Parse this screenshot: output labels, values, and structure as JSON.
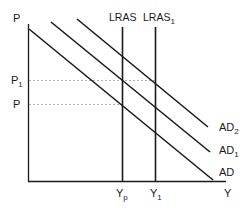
{
  "diagram": {
    "type": "economics-ad-lras",
    "axes": {
      "y_label": "P",
      "x_label": "Y"
    },
    "price_levels": [
      {
        "id": "p1",
        "label_base": "P",
        "label_sub": "1"
      },
      {
        "id": "p",
        "label_base": "P",
        "label_sub": ""
      }
    ],
    "output_levels": [
      {
        "id": "yp",
        "label_base": "Y",
        "label_sub": "p"
      },
      {
        "id": "y1",
        "label_base": "Y",
        "label_sub": "1"
      }
    ],
    "supply_curves": [
      {
        "id": "lras",
        "label_base": "LRAS",
        "label_sub": ""
      },
      {
        "id": "lras1",
        "label_base": "LRAS",
        "label_sub": "1"
      }
    ],
    "demand_curves": [
      {
        "id": "ad2",
        "label_base": "AD",
        "label_sub": "2"
      },
      {
        "id": "ad1",
        "label_base": "AD",
        "label_sub": "1"
      },
      {
        "id": "ad",
        "label_base": "AD",
        "label_sub": ""
      }
    ],
    "colors": {
      "line": "#1a1a1a",
      "dashed": "#9a9a9a",
      "background": "#ffffff"
    }
  }
}
